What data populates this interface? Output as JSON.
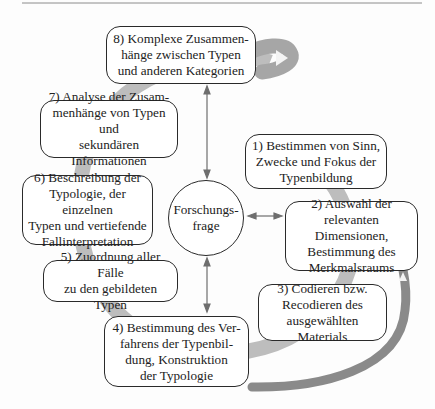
{
  "diagram": {
    "center": {
      "label": "Forschungs-\nfrage"
    },
    "steps": [
      {
        "id": 1,
        "label": "1) Bestimmen von Sinn,\nZwecke und Fokus der\nTypenbildung"
      },
      {
        "id": 2,
        "label": "2) Auswahl der\nrelevanten Dimensionen,\nBestimmung des\nMerkmalsraums"
      },
      {
        "id": 3,
        "label": "3) Codieren bzw.\nRecodieren des\nausgewählten Materials"
      },
      {
        "id": 4,
        "label": "4) Bestimmung des Ver-\nfahrens der Typenbil-\ndung, Konstruktion\nder Typologie"
      },
      {
        "id": 5,
        "label": "5) Zuordnung aller Fälle\nzu den gebildeten Typen"
      },
      {
        "id": 6,
        "label": "6) Beschreibung der\nTypologie, der einzelnen\nTypen und vertiefende\nFallinterpretation"
      },
      {
        "id": 7,
        "label": "7) Analyse der Zusam-\nmenhänge von Typen und\nsekundären Informationen"
      },
      {
        "id": 8,
        "label": "8) Komplexe Zusammen-\nhänge zwischen Typen\nund anderen Kategorien"
      }
    ],
    "connections": [
      {
        "from": "center",
        "to": 8,
        "type": "double-arrow"
      },
      {
        "from": "center",
        "to": 2,
        "type": "double-arrow"
      },
      {
        "from": "center",
        "to": 4,
        "type": "double-arrow"
      }
    ],
    "colors": {
      "cycle_arc": "#b9b9b9",
      "return_arc": "#8a8a8a",
      "border": "#2a2a2a",
      "arrow": "#6e6e6e"
    }
  }
}
